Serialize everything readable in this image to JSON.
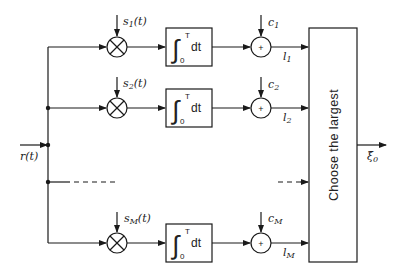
{
  "diagram": {
    "type": "block-diagram",
    "input": {
      "label": "r(t)"
    },
    "output": {
      "label": "ξ̂",
      "sub": "0"
    },
    "branches": [
      {
        "id": 1,
        "signal": "s",
        "signal_sub": "1",
        "signal_arg": "(t)",
        "bias": "c",
        "bias_sub": "1",
        "out": "l",
        "out_sub": "1"
      },
      {
        "id": 2,
        "signal": "s",
        "signal_sub": "2",
        "signal_arg": "(t)",
        "bias": "c",
        "bias_sub": "2",
        "out": "l",
        "out_sub": "2"
      },
      {
        "id": "M",
        "signal": "s",
        "signal_sub": "M",
        "signal_arg": "(t)",
        "bias": "c",
        "bias_sub": "M",
        "out": "l",
        "out_sub": "M"
      }
    ],
    "integrator": {
      "upper": "T",
      "lower": "0",
      "symbol": "∫",
      "dt": "dt"
    },
    "multiplier_symbol": "⊗",
    "adder_symbol": "+",
    "decision_block": {
      "label": "Choose the largest"
    }
  }
}
